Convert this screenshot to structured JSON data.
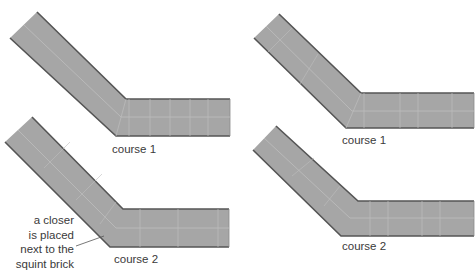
{
  "diagram": {
    "colors": {
      "brick_fill": "#a6a6a6",
      "joint": "#c4c4c4",
      "edge": "#555555",
      "text": "#3a3a3a"
    },
    "panels": [
      {
        "id": "left-course-1",
        "label": "course 1"
      },
      {
        "id": "left-course-2",
        "label": "course 2"
      },
      {
        "id": "right-course-1",
        "label": "course 1"
      },
      {
        "id": "right-course-2",
        "label": "course 2"
      }
    ],
    "annotation": {
      "lines": [
        "a closer",
        "is placed",
        "next to the",
        "squint brick"
      ]
    }
  }
}
